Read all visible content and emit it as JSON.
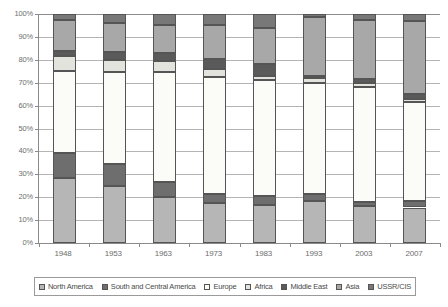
{
  "chart_data": {
    "type": "bar",
    "stacked": true,
    "normalized": true,
    "title": "",
    "subtitle": "",
    "xlabel": "",
    "ylabel": "",
    "ylim": [
      0,
      100
    ],
    "ytick_labels": [
      "0%",
      "10%",
      "20%",
      "30%",
      "40%",
      "50%",
      "60%",
      "70%",
      "80%",
      "90%",
      "100%"
    ],
    "ytick_values": [
      0,
      10,
      20,
      30,
      40,
      50,
      60,
      70,
      80,
      90,
      100
    ],
    "grid": true,
    "legend_position": "bottom",
    "categories": [
      "1948",
      "1953",
      "1963",
      "1973",
      "1983",
      "1993",
      "2003",
      "2007"
    ],
    "series": [
      {
        "name": "North America",
        "color": "#b6b6b6",
        "values": [
          28.5,
          25.0,
          20.0,
          17.5,
          16.5,
          18.5,
          16.0,
          15.5
        ]
      },
      {
        "name": "South and Central America",
        "color": "#6e6e6e",
        "values": [
          11.0,
          9.5,
          6.5,
          4.0,
          4.0,
          3.0,
          2.0,
          3.0
        ]
      },
      {
        "name": "Europe",
        "color": "#fbfbf7",
        "values": [
          35.5,
          40.0,
          48.0,
          51.0,
          50.5,
          48.5,
          50.0,
          43.0
        ]
      },
      {
        "name": "Africa",
        "color": "#e3e3de",
        "values": [
          6.5,
          5.5,
          5.0,
          3.5,
          2.0,
          2.0,
          2.0,
          1.5
        ]
      },
      {
        "name": "Middle East",
        "color": "#5a5a5a",
        "values": [
          2.5,
          3.5,
          3.5,
          4.5,
          5.0,
          1.0,
          1.5,
          2.0
        ]
      },
      {
        "name": "Asia",
        "color": "#a8a8a8",
        "values": [
          13.5,
          12.5,
          12.0,
          14.5,
          16.0,
          25.5,
          26.0,
          32.0
        ]
      },
      {
        "name": "USSR/CIS",
        "color": "#787878",
        "values": [
          2.5,
          4.0,
          5.0,
          5.0,
          6.0,
          1.5,
          2.5,
          3.0
        ]
      }
    ]
  },
  "legend": {
    "items": [
      {
        "label": "North America"
      },
      {
        "label": "South and Central America"
      },
      {
        "label": "Europe"
      },
      {
        "label": "Africa"
      },
      {
        "label": "Middle East"
      },
      {
        "label": "Asia"
      },
      {
        "label": "USSR/CIS"
      }
    ]
  },
  "colors": {
    "axis": "#8a8a8a",
    "gridline": "#b4b4b4",
    "tick_text": "#6e6e6e",
    "legend_text": "#4a4a4a",
    "segment_border": "#555555",
    "background": "#ffffff"
  }
}
